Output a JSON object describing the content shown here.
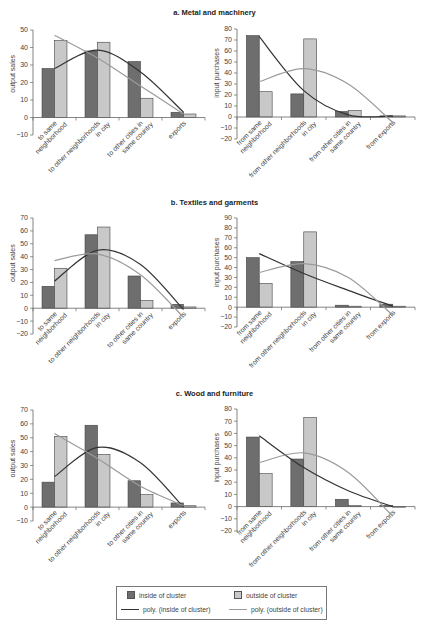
{
  "figure": {
    "legend": {
      "inside_bar": "inside of cluster",
      "outside_bar": "outside of cluster",
      "inside_poly": "poly. (inside of cluster)",
      "outside_poly": "poly. (outside of cluster)"
    },
    "colors": {
      "inside_bar": "#6e6e6e",
      "outside_bar": "#c8c8c8",
      "inside_poly": "#333333",
      "outside_poly": "#9a9a9a",
      "axis": "#666666"
    }
  },
  "panels": [
    {
      "title": "a. Metal and machinery"
    },
    {
      "title": "b. Textiles and garments"
    },
    {
      "title": "c. Wood and furniture"
    }
  ],
  "chart_data": [
    {
      "id": "a-output",
      "panel": "a. Metal and machinery",
      "type": "bar",
      "ylabel": "output sales",
      "categories": [
        "to same neighborhood",
        "to other neighborhoods in city",
        "to other cities in same country",
        "exports"
      ],
      "category_lines": [
        [
          "to same",
          "neighborhood"
        ],
        [
          "to other neighborhoods",
          "in city"
        ],
        [
          "to other cities in",
          "same country"
        ],
        [
          "exports"
        ]
      ],
      "series": [
        {
          "name": "inside of cluster",
          "values": [
            28,
            38,
            32,
            3
          ]
        },
        {
          "name": "outside of cluster",
          "values": [
            44,
            43,
            11,
            2
          ]
        }
      ],
      "trendlines": [
        {
          "name": "poly. (inside of cluster)",
          "points": [
            28,
            38.5,
            26,
            3
          ]
        },
        {
          "name": "poly. (outside of cluster)",
          "points": [
            47,
            34,
            18,
            2
          ]
        }
      ],
      "ylim": [
        -10,
        50
      ],
      "yticks": [
        -10,
        0,
        10,
        20,
        30,
        40,
        50
      ],
      "grid": false,
      "legend_position": "bottom"
    },
    {
      "id": "a-input",
      "panel": "a. Metal and machinery",
      "type": "bar",
      "ylabel": "input purchases",
      "categories": [
        "from same neighborhood",
        "from other neighborhoods in city",
        "from other cities in same country",
        "from exports"
      ],
      "category_lines": [
        [
          "from same",
          "neighborhood"
        ],
        [
          "from other neighborhoods",
          "in city"
        ],
        [
          "from other cities in",
          "same country"
        ],
        [
          "from exports"
        ]
      ],
      "series": [
        {
          "name": "inside of cluster",
          "values": [
            74,
            21,
            5,
            1
          ]
        },
        {
          "name": "outside of cluster",
          "values": [
            23,
            71,
            6,
            1
          ]
        }
      ],
      "trendlines": [
        {
          "name": "poly. (inside of cluster)",
          "points": [
            73,
            24,
            2,
            1
          ]
        },
        {
          "name": "poly. (outside of cluster)",
          "points": [
            32,
            44,
            30,
            -5
          ]
        }
      ],
      "ylim": [
        -20,
        80
      ],
      "yticks": [
        -20,
        -10,
        0,
        10,
        20,
        30,
        40,
        50,
        60,
        70,
        80
      ],
      "grid": false,
      "legend_position": "bottom"
    },
    {
      "id": "b-output",
      "panel": "b. Textiles and garments",
      "type": "bar",
      "ylabel": "output sales",
      "categories": [
        "to same neighborhood",
        "to other neighborhoods in city",
        "to other cities in same country",
        "exports"
      ],
      "category_lines": [
        [
          "to same",
          "neighborhood"
        ],
        [
          "to other neighborhoods",
          "in city"
        ],
        [
          "to other cities in",
          "same country"
        ],
        [
          "exports"
        ]
      ],
      "series": [
        {
          "name": "inside of cluster",
          "values": [
            17,
            57,
            25,
            3
          ]
        },
        {
          "name": "outside of cluster",
          "values": [
            31,
            63,
            6,
            1
          ]
        }
      ],
      "trendlines": [
        {
          "name": "poly. (inside of cluster)",
          "points": [
            21,
            45,
            34,
            -1
          ]
        },
        {
          "name": "poly. (outside of cluster)",
          "points": [
            37,
            42,
            26,
            -7
          ]
        }
      ],
      "ylim": [
        -20,
        70
      ],
      "yticks": [
        -20,
        -10,
        0,
        10,
        20,
        30,
        40,
        50,
        60,
        70
      ],
      "grid": false,
      "legend_position": "bottom"
    },
    {
      "id": "b-input",
      "panel": "b. Textiles and garments",
      "type": "bar",
      "ylabel": "input purchases",
      "categories": [
        "from same neighborhood",
        "from other neighborhoods in city",
        "from other cities in same country",
        "from exports"
      ],
      "category_lines": [
        [
          "from same",
          "neighborhood"
        ],
        [
          "from other neighborhoods",
          "in city"
        ],
        [
          "from other cities in",
          "same country"
        ],
        [
          "from exports"
        ]
      ],
      "series": [
        {
          "name": "inside of cluster",
          "values": [
            50,
            46,
            2,
            3
          ]
        },
        {
          "name": "outside of cluster",
          "values": [
            24,
            76,
            1,
            1
          ]
        }
      ],
      "trendlines": [
        {
          "name": "poly. (inside of cluster)",
          "points": [
            54,
            34,
            17,
            1
          ]
        },
        {
          "name": "poly. (outside of cluster)",
          "points": [
            35,
            44,
            30,
            -8
          ]
        }
      ],
      "ylim": [
        -20,
        90
      ],
      "yticks": [
        -20,
        -10,
        0,
        10,
        20,
        30,
        40,
        50,
        60,
        70,
        80,
        90
      ],
      "grid": false,
      "legend_position": "bottom"
    },
    {
      "id": "c-output",
      "panel": "c. Wood and furniture",
      "type": "bar",
      "ylabel": "output sales",
      "categories": [
        "to same neighborhood",
        "to other neighborhoods in city",
        "to other cities in same country",
        "exports"
      ],
      "category_lines": [
        [
          "to same",
          "neighborhood"
        ],
        [
          "to other neighborhoods",
          "in city"
        ],
        [
          "to other cities in",
          "same country"
        ],
        [
          "exports"
        ]
      ],
      "series": [
        {
          "name": "inside of cluster",
          "values": [
            18,
            59,
            19,
            3
          ]
        },
        {
          "name": "outside of cluster",
          "values": [
            51,
            38,
            9,
            1
          ]
        }
      ],
      "trendlines": [
        {
          "name": "poly. (inside of cluster)",
          "points": [
            22,
            43,
            32,
            0
          ]
        },
        {
          "name": "poly. (outside of cluster)",
          "points": [
            53,
            35,
            15,
            1
          ]
        }
      ],
      "ylim": [
        -10,
        70
      ],
      "yticks": [
        -10,
        0,
        10,
        20,
        30,
        40,
        50,
        60,
        70
      ],
      "grid": false,
      "legend_position": "bottom"
    },
    {
      "id": "c-input",
      "panel": "c. Wood and furniture",
      "type": "bar",
      "ylabel": "input purchases",
      "categories": [
        "from same neighborhood",
        "from other neighborhoods in city",
        "from other cities in same country",
        "from exports"
      ],
      "category_lines": [
        [
          "from same",
          "neighborhood"
        ],
        [
          "from other neighborhoods",
          "in city"
        ],
        [
          "from other cities in",
          "same country"
        ],
        [
          "from exports"
        ]
      ],
      "series": [
        {
          "name": "inside of cluster",
          "values": [
            57,
            39,
            6,
            1
          ]
        },
        {
          "name": "outside of cluster",
          "values": [
            27,
            73,
            1,
            0
          ]
        }
      ],
      "trendlines": [
        {
          "name": "poly. (inside of cluster)",
          "points": [
            58,
            32,
            13,
            0
          ]
        },
        {
          "name": "poly. (outside of cluster)",
          "points": [
            36,
            44,
            28,
            -8
          ]
        }
      ],
      "ylim": [
        -20,
        80
      ],
      "yticks": [
        -20,
        -10,
        0,
        10,
        20,
        30,
        40,
        50,
        60,
        70,
        80
      ],
      "grid": false,
      "legend_position": "bottom"
    }
  ]
}
